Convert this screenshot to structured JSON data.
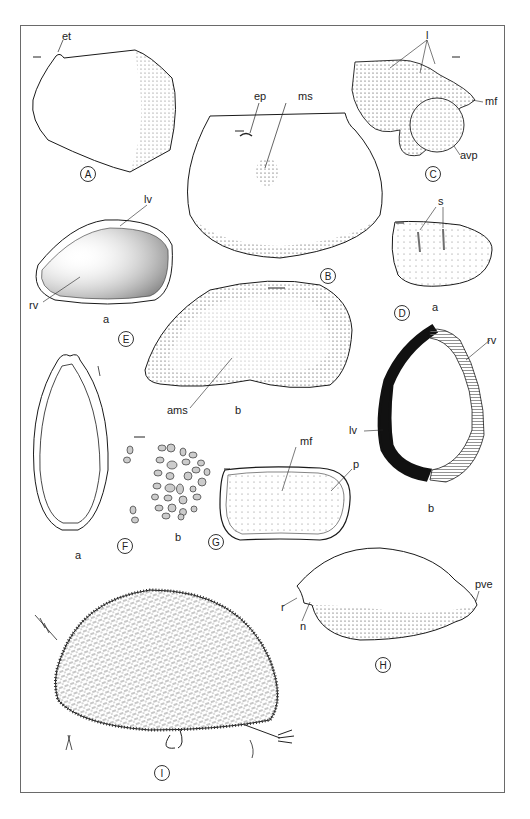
{
  "figure": {
    "panels": [
      {
        "id": "A",
        "label": "A",
        "annotations": [
          "et"
        ]
      },
      {
        "id": "B",
        "label": "B",
        "annotations": [
          "ep",
          "ms"
        ]
      },
      {
        "id": "C",
        "label": "C",
        "annotations": [
          "l",
          "mf",
          "avp"
        ]
      },
      {
        "id": "D",
        "label": "D",
        "annotations": [
          "s",
          "rv",
          "lv"
        ],
        "subpanels": [
          "a",
          "b"
        ]
      },
      {
        "id": "E",
        "label": "E",
        "annotations": [
          "lv",
          "rv",
          "ams"
        ],
        "subpanels": [
          "a",
          "b"
        ]
      },
      {
        "id": "F",
        "label": "F",
        "subpanels": [
          "a",
          "b"
        ]
      },
      {
        "id": "G",
        "label": "G",
        "annotations": [
          "mf",
          "p"
        ]
      },
      {
        "id": "H",
        "label": "H",
        "annotations": [
          "r",
          "n",
          "pve"
        ]
      },
      {
        "id": "I",
        "label": "I"
      }
    ]
  },
  "labels": {
    "A": "A",
    "B": "B",
    "C": "C",
    "D": "D",
    "E": "E",
    "F": "F",
    "G": "G",
    "H": "H",
    "I": "I",
    "et": "et",
    "ep": "ep",
    "ms": "ms",
    "l": "l",
    "mf_c": "mf",
    "avp": "avp",
    "s": "s",
    "lv_e": "lv",
    "rv_e": "rv",
    "ea": "a",
    "eb": "b",
    "ams": "ams",
    "da": "a",
    "rv_d": "rv",
    "lv_d": "lv",
    "db": "b",
    "fa": "a",
    "fb": "b",
    "mf_g": "mf",
    "p": "p",
    "r": "r",
    "n": "n",
    "pve": "pve"
  },
  "colors": {
    "ink": "#1a1a1a",
    "stipple": "#555555",
    "frame": "#6a6a6a",
    "hatch_fill": "#bdbdbd"
  }
}
